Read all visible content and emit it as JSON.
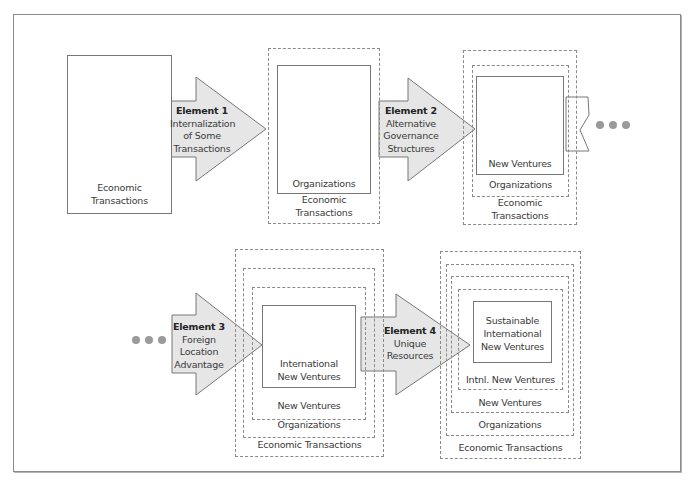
{
  "diagram": {
    "type": "process-flow",
    "top_row": {
      "stage1": {
        "label_line1": "Economic",
        "label_line2": "Transactions"
      },
      "element1": {
        "title": "Element 1",
        "line1": "Internalization",
        "line2": "of Some",
        "line3": "Transactions"
      },
      "stage2": {
        "inner": "Organizations",
        "outer_line1": "Economic",
        "outer_line2": "Transactions"
      },
      "element2": {
        "title": "Element 2",
        "line1": "Alternative",
        "line2": "Governance",
        "line3": "Structures"
      },
      "stage3": {
        "inner": "New Ventures",
        "middle": "Organizations",
        "outer_line1": "Economic",
        "outer_line2": "Transactions"
      },
      "continuation": "•••"
    },
    "bottom_row": {
      "continuation": "•••",
      "element3": {
        "title": "Element 3",
        "line1": "Foreign",
        "line2": "Location",
        "line3": "Advantage"
      },
      "stage4": {
        "inner_line1": "International",
        "inner_line2": "New Ventures",
        "level2": "New Ventures",
        "level3": "Organizations",
        "level4": "Economic Transactions"
      },
      "element4": {
        "title": "Element 4",
        "line1": "Unique",
        "line2": "Resources"
      },
      "stage5": {
        "inner_line1": "Sustainable",
        "inner_line2": "International",
        "inner_line3": "New Ventures",
        "level2": "Intnl. New Ventures",
        "level3": "New Ventures",
        "level4": "Organizations",
        "level5": "Economic Transactions"
      }
    },
    "colors": {
      "arrow_fill": "#e6e6e6",
      "line": "#777777",
      "dash": "#8a8a8a",
      "dots": "#9a9a9a"
    }
  }
}
